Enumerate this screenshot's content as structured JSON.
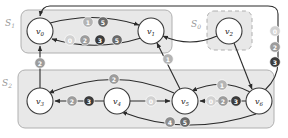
{
  "diagram": {
    "colors": {
      "region_fill": "#e8e8e8",
      "region_stroke": "#b0b0b0",
      "region_label": "#9a9a9a",
      "node_fill": "#ffffff",
      "node_stroke": "#3a3a3a",
      "edge_stroke": "#2b2b2b",
      "label_0": "#d2d2d2",
      "label_1": "#b4b4b4",
      "label_2": "#9c9c9c",
      "label_3": "#3c3c3c",
      "label_4": "#8e8e8e",
      "label_5": "#6a6a6a",
      "label_text": "#ffffff"
    },
    "regions": [
      {
        "id": "S1",
        "label": "S",
        "sub": "1",
        "style": "solid",
        "x": 21,
        "y": 10,
        "w": 151,
        "h": 43
      },
      {
        "id": "S0",
        "label": "S",
        "sub": "0",
        "style": "dashed",
        "x": 207,
        "y": 11,
        "w": 45,
        "h": 39
      },
      {
        "id": "S2",
        "label": "S",
        "sub": "2",
        "style": "solid",
        "x": 18,
        "y": 70,
        "w": 256,
        "h": 58
      }
    ],
    "nodes": [
      {
        "id": "v0",
        "label": "v",
        "sub": "0",
        "cx": 40,
        "cy": 31,
        "r": 13
      },
      {
        "id": "v1",
        "label": "v",
        "sub": "1",
        "cx": 151,
        "cy": 31,
        "r": 13
      },
      {
        "id": "v2",
        "label": "v",
        "sub": "2",
        "cx": 229,
        "cy": 31,
        "r": 13
      },
      {
        "id": "v3",
        "label": "v",
        "sub": "3",
        "cx": 40,
        "cy": 101,
        "r": 13
      },
      {
        "id": "v4",
        "label": "v",
        "sub": "4",
        "cx": 117,
        "cy": 101,
        "r": 13
      },
      {
        "id": "v5",
        "label": "v",
        "sub": "5",
        "cx": 185,
        "cy": 101,
        "r": 13
      },
      {
        "id": "v6",
        "label": "v",
        "sub": "6",
        "cx": 259,
        "cy": 101,
        "r": 13
      }
    ],
    "edges": [
      {
        "id": "e-v0-v1-top",
        "from": "v0",
        "to": "v1",
        "labels": [
          "1",
          "5"
        ]
      },
      {
        "id": "e-v1-v0-bottom",
        "from": "v1",
        "to": "v0",
        "labels": [
          "0",
          "2",
          "3",
          "5"
        ]
      },
      {
        "id": "e-v3-v0",
        "from": "v3",
        "to": "v0",
        "labels": [
          "2"
        ]
      },
      {
        "id": "e-v4-v3",
        "from": "v4",
        "to": "v3",
        "labels": [
          "2",
          "3"
        ]
      },
      {
        "id": "e-v4-v5",
        "from": "v4",
        "to": "v5",
        "labels": [
          "0"
        ]
      },
      {
        "id": "e-v5-v3-arc",
        "from": "v5",
        "to": "v3",
        "labels": [
          "2"
        ]
      },
      {
        "id": "e-v5-v1",
        "from": "v5",
        "to": "v1",
        "labels": [
          "1"
        ]
      },
      {
        "id": "e-v6-v5",
        "from": "v6",
        "to": "v5",
        "labels": [
          "0",
          "2",
          "3"
        ]
      },
      {
        "id": "e-v6-v5-arc",
        "from": "v6",
        "to": "v5",
        "labels": [
          "1"
        ]
      },
      {
        "id": "e-v6-v4-arc",
        "from": "v6",
        "to": "v4",
        "labels": [
          "4",
          "5"
        ]
      },
      {
        "id": "e-v6-v0-outer",
        "from": "v6",
        "to": "v0",
        "labels": [
          "0",
          "2",
          "3"
        ]
      },
      {
        "id": "e-v2-v1",
        "from": "v2",
        "to": "v1",
        "labels": []
      },
      {
        "id": "e-v2-v6",
        "from": "v2",
        "to": "v6",
        "labels": []
      }
    ],
    "edge_labels": [
      {
        "id": "lab-v0v1-1",
        "edge": "e-v0-v1-top",
        "value": "1",
        "x": 88,
        "y": 22
      },
      {
        "id": "lab-v0v1-5",
        "edge": "e-v0-v1-top",
        "value": "5",
        "x": 103,
        "y": 22
      },
      {
        "id": "lab-v1v0-0",
        "edge": "e-v1-v0-bottom",
        "value": "0",
        "x": 70,
        "y": 40
      },
      {
        "id": "lab-v1v0-2",
        "edge": "e-v1-v0-bottom",
        "value": "2",
        "x": 85,
        "y": 40
      },
      {
        "id": "lab-v1v0-3",
        "edge": "e-v1-v0-bottom",
        "value": "3",
        "x": 100,
        "y": 40
      },
      {
        "id": "lab-v1v0-5",
        "edge": "e-v1-v0-bottom",
        "value": "5",
        "x": 117,
        "y": 40
      },
      {
        "id": "lab-v3v0-2",
        "edge": "e-v3-v0",
        "value": "2",
        "x": 40,
        "y": 63
      },
      {
        "id": "lab-v4v3-2",
        "edge": "e-v4-v3",
        "value": "2",
        "x": 72,
        "y": 101
      },
      {
        "id": "lab-v4v3-3",
        "edge": "e-v4-v3",
        "value": "3",
        "x": 89,
        "y": 101
      },
      {
        "id": "lab-v4v5-0",
        "edge": "e-v4-v5",
        "value": "0",
        "x": 151,
        "y": 101
      },
      {
        "id": "lab-v5v3-2",
        "edge": "e-v5-v3-arc",
        "value": "2",
        "x": 114,
        "y": 79
      },
      {
        "id": "lab-v5v1-1",
        "edge": "e-v5-v1",
        "value": "1",
        "x": 168,
        "y": 59
      },
      {
        "id": "lab-v6v5-0",
        "edge": "e-v6-v5",
        "value": "0",
        "x": 211,
        "y": 101
      },
      {
        "id": "lab-v6v5-2",
        "edge": "e-v6-v5",
        "value": "2",
        "x": 223,
        "y": 101
      },
      {
        "id": "lab-v6v5-3",
        "edge": "e-v6-v5",
        "value": "3",
        "x": 236,
        "y": 101
      },
      {
        "id": "lab-v6v5-1",
        "edge": "e-v6-v5-arc",
        "value": "1",
        "x": 222,
        "y": 85
      },
      {
        "id": "lab-v6v4-4",
        "edge": "e-v6-v4-arc",
        "value": "4",
        "x": 170,
        "y": 122
      },
      {
        "id": "lab-v6v4-5",
        "edge": "e-v6-v4-arc",
        "value": "5",
        "x": 185,
        "y": 122
      },
      {
        "id": "lab-v6v0-0",
        "edge": "e-v6-v0-outer",
        "value": "0",
        "x": 275,
        "y": 31
      },
      {
        "id": "lab-v6v0-2",
        "edge": "e-v6-v0-outer",
        "value": "2",
        "x": 275,
        "y": 47
      },
      {
        "id": "lab-v6v0-3",
        "edge": "e-v6-v0-outer",
        "value": "3",
        "x": 275,
        "y": 62
      }
    ]
  }
}
